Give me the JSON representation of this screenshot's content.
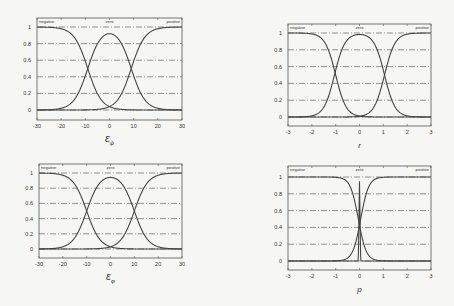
{
  "figure": {
    "membership_labels": [
      "negative",
      "zero",
      "positive"
    ]
  },
  "chart_data": [
    {
      "type": "line",
      "id": "top-left",
      "title": "",
      "xlabel": "ε_ψ",
      "xlabel_main": "ε",
      "xlabel_sub": "ψ",
      "ylabel": "",
      "xlim": [
        -30,
        30
      ],
      "ylim": [
        0,
        1
      ],
      "xticks": [
        -30,
        -20,
        -10,
        0,
        10,
        20,
        30
      ],
      "yticks": [
        0,
        0.2,
        0.4,
        0.6,
        0.8,
        1
      ],
      "ytick_labels": [
        "0",
        "0.2",
        "0.4",
        "0.6",
        "0.8",
        "1"
      ],
      "grid": true,
      "annotations": [
        "negative",
        "zero",
        "positive"
      ],
      "series": [
        {
          "name": "negative",
          "shape": "z-sigmoid",
          "crossover": -9,
          "slope": 0.35
        },
        {
          "name": "zero",
          "shape": "bell",
          "center": 0,
          "half_width": 9,
          "slope": 0.35
        },
        {
          "name": "positive",
          "shape": "s-sigmoid",
          "crossover": 9,
          "slope": 0.35
        }
      ]
    },
    {
      "type": "line",
      "id": "top-right",
      "title": "",
      "xlabel": "r",
      "xlabel_main": "r",
      "xlabel_sub": "",
      "ylabel": "",
      "xlim": [
        -3,
        3
      ],
      "ylim": [
        0,
        1
      ],
      "xticks": [
        -3,
        -2,
        -1,
        0,
        1,
        2,
        3
      ],
      "yticks": [
        0,
        0.2,
        0.4,
        0.6,
        0.8,
        1
      ],
      "ytick_labels": [
        "0",
        "0.2",
        "0.4",
        "0.6",
        "0.8",
        "1"
      ],
      "grid": true,
      "annotations": [
        "negative",
        "zero",
        "positive"
      ],
      "series": [
        {
          "name": "negative",
          "shape": "z-sigmoid",
          "crossover": -1,
          "slope": 4.5
        },
        {
          "name": "zero",
          "shape": "bell",
          "center": 0,
          "half_width": 1.05,
          "slope": 4.5
        },
        {
          "name": "positive",
          "shape": "s-sigmoid",
          "crossover": 1.05,
          "slope": 4.5
        }
      ]
    },
    {
      "type": "line",
      "id": "bottom-left",
      "title": "",
      "xlabel": "ε_φ",
      "xlabel_main": "ε",
      "xlabel_sub": "φ",
      "ylabel": "",
      "xlim": [
        -30,
        30
      ],
      "ylim": [
        0,
        1
      ],
      "xticks": [
        -30,
        -20,
        -10,
        0,
        10,
        20,
        30
      ],
      "yticks": [
        0,
        0.2,
        0.4,
        0.6,
        0.8,
        1
      ],
      "ytick_labels": [
        "0",
        "0.2",
        "0.4",
        "0.6",
        "0.8",
        "1"
      ],
      "grid": true,
      "annotations": [
        "negative",
        "zero",
        "positive"
      ],
      "series": [
        {
          "name": "negative",
          "shape": "z-sigmoid",
          "crossover": -10,
          "slope": 0.35
        },
        {
          "name": "zero",
          "shape": "bell",
          "center": 0,
          "half_width": 10,
          "slope": 0.35
        },
        {
          "name": "positive",
          "shape": "s-sigmoid",
          "crossover": 10,
          "slope": 0.35
        }
      ]
    },
    {
      "type": "line",
      "id": "bottom-right",
      "title": "",
      "xlabel": "p",
      "xlabel_main": "p",
      "xlabel_sub": "",
      "ylabel": "",
      "xlim": [
        -3,
        3
      ],
      "ylim": [
        0,
        1
      ],
      "xticks": [
        -3,
        -2,
        -1,
        0,
        1,
        2,
        3
      ],
      "yticks": [
        0,
        0.2,
        0.4,
        0.6,
        0.8,
        1
      ],
      "ytick_labels": [
        "0",
        "0.2",
        "0.4",
        "0.6",
        "0.8",
        "1"
      ],
      "grid": true,
      "annotations": [
        "negative",
        "zero",
        "positive"
      ],
      "series": [
        {
          "name": "negative",
          "shape": "z-sigmoid",
          "crossover": -0.05,
          "slope": 6
        },
        {
          "name": "zero",
          "shape": "spike",
          "center": 0,
          "half_width": 0.05,
          "peak": 0.95
        },
        {
          "name": "positive",
          "shape": "s-sigmoid",
          "crossover": 0.05,
          "slope": 6
        }
      ]
    }
  ]
}
